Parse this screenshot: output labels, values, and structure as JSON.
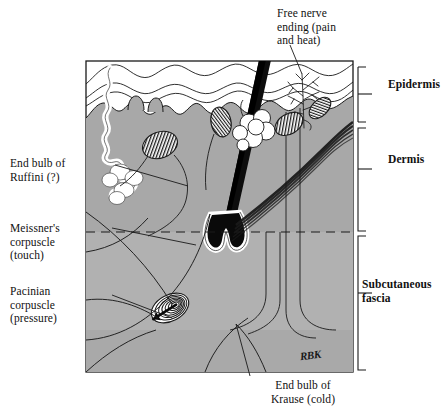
{
  "figure": {
    "signature": "RBK",
    "colors": {
      "dermis_fill": "#a8a8a8",
      "epidermis_fill": "#ffffff",
      "outline": "#1a1a1a",
      "page_background": "#ffffff"
    }
  },
  "labels": {
    "ruffini": "End bulb of\nRuffini (?)",
    "meissner": "Meissner's\ncorpuscle\n(touch)",
    "pacinian": "Pacinian\ncorpuscle\n(pressure)",
    "free_nerve": "Free nerve\nending (pain\nand heat)",
    "krause": "End bulb of\nKrause (cold)"
  },
  "layers": [
    {
      "name": "epidermis",
      "label": "Epidermis"
    },
    {
      "name": "dermis",
      "label": "Dermis"
    },
    {
      "name": "subcutaneous_fascia",
      "label": "Subcutaneous\nfascia"
    }
  ],
  "structures": [
    {
      "name": "hair-shaft"
    },
    {
      "name": "hair-bulb"
    },
    {
      "name": "sebaceous-gland"
    },
    {
      "name": "arrector-pili-muscle"
    },
    {
      "name": "ruffini-ending"
    },
    {
      "name": "meissner-corpuscle"
    },
    {
      "name": "pacinian-corpuscle"
    },
    {
      "name": "krause-end-bulb"
    },
    {
      "name": "free-nerve-ending"
    }
  ]
}
